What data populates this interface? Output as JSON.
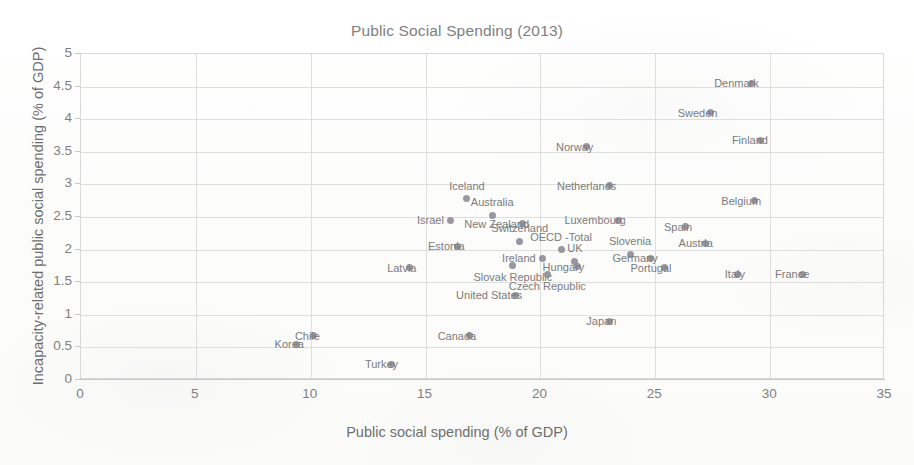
{
  "chart_data": {
    "type": "scatter",
    "title": "Public Social Spending (2013)",
    "xlabel": "Public social spending (% of GDP)",
    "ylabel": "Incapacity-related public social spending (% of GDP)",
    "xlim": [
      0,
      35
    ],
    "ylim": [
      0,
      5
    ],
    "xticks": [
      "0",
      "5",
      "10",
      "15",
      "20",
      "25",
      "30",
      "35"
    ],
    "xtick_values": [
      0,
      5,
      10,
      15,
      20,
      25,
      30,
      35
    ],
    "yticks": [
      "0",
      "0.5",
      "1",
      "1.5",
      "2",
      "2.5",
      "3",
      "3.5",
      "4",
      "4.5",
      "5"
    ],
    "ytick_values": [
      0,
      0.5,
      1,
      1.5,
      2,
      2.5,
      3,
      3.5,
      4,
      4.5,
      5
    ],
    "grid": "both",
    "legend": "none",
    "marker_color": "#8a8a95",
    "label_color": "#7b7b7b",
    "gridline_color": "#dedede",
    "points": [
      {
        "name": "Denmark",
        "x": 29.2,
        "y": 4.55,
        "label_pos": "right"
      },
      {
        "name": "Sweden",
        "x": 27.4,
        "y": 4.1,
        "label_pos": "right"
      },
      {
        "name": "Finland",
        "x": 29.6,
        "y": 3.68,
        "label_pos": "right"
      },
      {
        "name": "Norway",
        "x": 22.0,
        "y": 3.58,
        "label_pos": "right"
      },
      {
        "name": "Netherlands",
        "x": 23.0,
        "y": 2.98,
        "label_pos": "right"
      },
      {
        "name": "Iceland",
        "x": 16.8,
        "y": 2.78,
        "label_pos": "above"
      },
      {
        "name": "Belgium",
        "x": 29.3,
        "y": 2.75,
        "label_pos": "right"
      },
      {
        "name": "Australia",
        "x": 17.9,
        "y": 2.53,
        "label_pos": "above"
      },
      {
        "name": "Israel",
        "x": 16.1,
        "y": 2.45,
        "label_pos": "left"
      },
      {
        "name": "Luxembourg",
        "x": 23.4,
        "y": 2.45,
        "label_pos": "right"
      },
      {
        "name": "New Zealand",
        "x": 19.2,
        "y": 2.4,
        "label_pos": "right"
      },
      {
        "name": "Spain",
        "x": 26.3,
        "y": 2.35,
        "label_pos": "right"
      },
      {
        "name": "Switzerland",
        "x": 19.1,
        "y": 2.13,
        "label_pos": "above"
      },
      {
        "name": "Austria",
        "x": 27.2,
        "y": 2.1,
        "label_pos": "right"
      },
      {
        "name": "Estonia",
        "x": 16.4,
        "y": 2.05,
        "label_pos": "right"
      },
      {
        "name": "OECD -Total",
        "x": 20.9,
        "y": 2.0,
        "label_pos": "above"
      },
      {
        "name": "Slovenia",
        "x": 23.9,
        "y": 1.93,
        "label_pos": "above"
      },
      {
        "name": "Ireland",
        "x": 20.1,
        "y": 1.87,
        "label_pos": "left"
      },
      {
        "name": "Germany",
        "x": 24.8,
        "y": 1.87,
        "label_pos": "right"
      },
      {
        "name": "UK",
        "x": 21.5,
        "y": 1.82,
        "label_pos": "above"
      },
      {
        "name": "Hungary",
        "x": 21.6,
        "y": 1.74,
        "label_pos": "right"
      },
      {
        "name": "Slovak Republic",
        "x": 18.8,
        "y": 1.76,
        "label_pos": "below"
      },
      {
        "name": "Portugal",
        "x": 25.4,
        "y": 1.72,
        "label_pos": "right"
      },
      {
        "name": "Latvia",
        "x": 14.3,
        "y": 1.72,
        "label_pos": "right"
      },
      {
        "name": "Italy",
        "x": 28.6,
        "y": 1.62,
        "label_pos": "right"
      },
      {
        "name": "France",
        "x": 31.4,
        "y": 1.62,
        "label_pos": "right"
      },
      {
        "name": "Czech Republic",
        "x": 20.3,
        "y": 1.62,
        "label_pos": "below"
      },
      {
        "name": "United States",
        "x": 18.9,
        "y": 1.3,
        "label_pos": "right"
      },
      {
        "name": "Japan",
        "x": 23.0,
        "y": 0.9,
        "label_pos": "right"
      },
      {
        "name": "Chile",
        "x": 10.1,
        "y": 0.68,
        "label_pos": "right"
      },
      {
        "name": "Canada",
        "x": 16.9,
        "y": 0.68,
        "label_pos": "right"
      },
      {
        "name": "Korea",
        "x": 9.4,
        "y": 0.55,
        "label_pos": "right"
      },
      {
        "name": "Turkey",
        "x": 13.5,
        "y": 0.24,
        "label_pos": "right"
      }
    ]
  }
}
